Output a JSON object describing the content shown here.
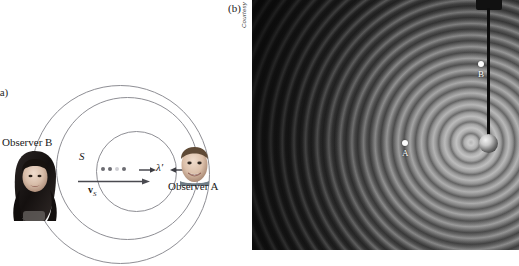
{
  "figure": {
    "panel_a": {
      "label": "(a)",
      "source_label": "S",
      "velocity_label_prefix": "v",
      "velocity_label_sub": "S",
      "wavelength_label": "λ′",
      "observer_a_label": "Observer A",
      "observer_b_label": "Observer B",
      "wavefront_count": 3,
      "source_dot_count": 4,
      "icons": {
        "velocity_arrow": "arrow-right-icon",
        "measure_left_arrow": "arrow-right-icon",
        "measure_right_arrow": "arrow-left-icon",
        "observer_a_face": "male-face-photo",
        "observer_b_face": "female-face-photo"
      }
    },
    "panel_b": {
      "label": "(b)",
      "credit": "Courtesy of the Educational Development Center, Newton, MA",
      "point_a_label": "A",
      "point_b_label": "B",
      "icons": {
        "vibrator_rod": "vertical-rod-icon",
        "wave_source": "sphere-bob-icon",
        "photo": "ripple-tank-photo"
      }
    }
  },
  "colors": {
    "page_background": "#ffffff",
    "wavefront_stroke": "#8e8e94",
    "arrow_fill": "#4a4a50",
    "source_dot": "#6c6c72",
    "source_dot_faint": "#cfcfd4",
    "text": "#1a1a1a",
    "photo_dark": "#1e1e1e",
    "photo_light": "#bebebe",
    "photo_point": "#fdfdfd",
    "rod": "#0d0d0d"
  }
}
